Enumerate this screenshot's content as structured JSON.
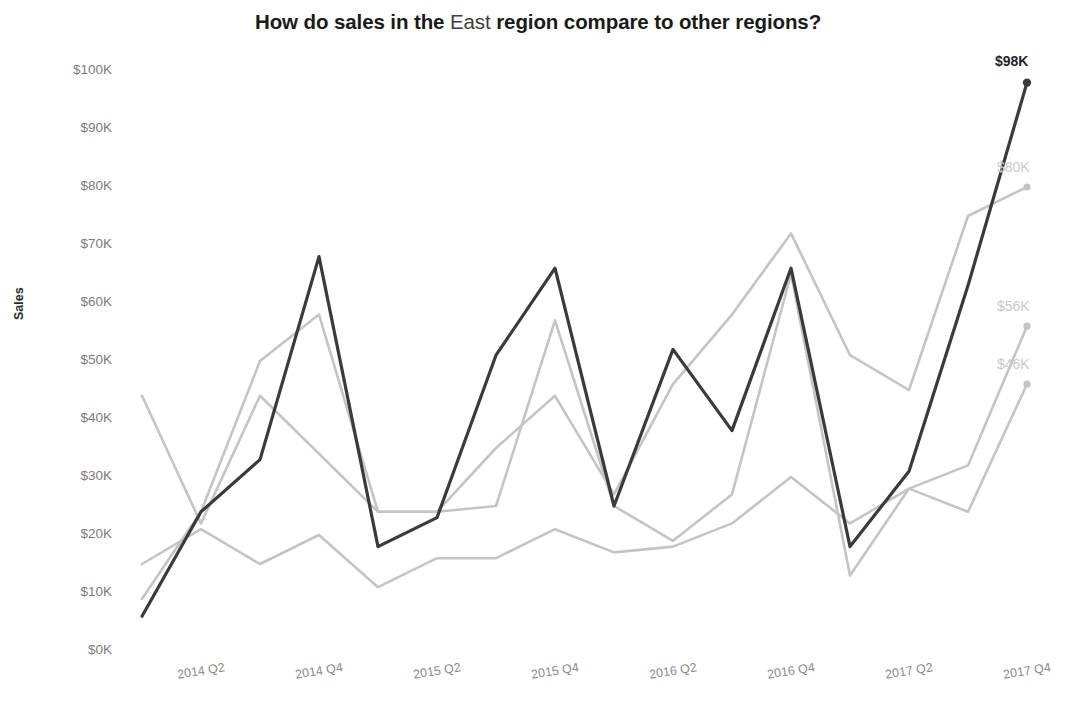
{
  "chart_data": {
    "type": "line",
    "title": "How do sales in the East region compare to other regions?",
    "title_emphasis": "East",
    "xlabel": "",
    "ylabel": "Sales",
    "ylim": [
      0,
      100000
    ],
    "grid": false,
    "legend": "none (end-of-line labels)",
    "y_tick_labels": [
      "$100K",
      "$90K",
      "$80K",
      "$70K",
      "$60K",
      "$50K",
      "$40K",
      "$30K",
      "$20K",
      "$10K",
      "$0K"
    ],
    "y_tick_values": [
      100000,
      90000,
      80000,
      70000,
      60000,
      50000,
      40000,
      30000,
      20000,
      10000,
      0
    ],
    "x": [
      "2014 Q1",
      "2014 Q2",
      "2014 Q3",
      "2014 Q4",
      "2015 Q1",
      "2015 Q2",
      "2015 Q3",
      "2015 Q4",
      "2016 Q1",
      "2016 Q2",
      "2016 Q3",
      "2016 Q4",
      "2017 Q1",
      "2017 Q2",
      "2017 Q3",
      "2017 Q4"
    ],
    "x_tick_labels": [
      "2014 Q2",
      "2014 Q4",
      "2015 Q2",
      "2015 Q4",
      "2016 Q2",
      "2016 Q4",
      "2017 Q2",
      "2017 Q4"
    ],
    "series": [
      {
        "name": "East",
        "color": "#3a3a3a",
        "highlight": true,
        "stroke_width": 3.2,
        "end_label": "$98K",
        "end_value": 98000,
        "values": [
          6000,
          24000,
          33000,
          68000,
          18000,
          23000,
          51000,
          66000,
          25000,
          52000,
          38000,
          66000,
          18000,
          31000,
          63000,
          98000
        ]
      },
      {
        "name": "Other region A",
        "color": "#c4c4c4",
        "highlight": false,
        "stroke_width": 2.6,
        "end_label": "$80K",
        "end_value": 80000,
        "values": [
          9000,
          24000,
          50000,
          58000,
          24000,
          24000,
          35000,
          44000,
          27000,
          46000,
          58000,
          72000,
          51000,
          45000,
          75000,
          80000
        ]
      },
      {
        "name": "Other region B",
        "color": "#c4c4c4",
        "highlight": false,
        "stroke_width": 2.6,
        "end_label": "$56K",
        "end_value": 56000,
        "values": [
          44000,
          22000,
          44000,
          34000,
          24000,
          24000,
          25000,
          57000,
          25000,
          19000,
          27000,
          65000,
          13000,
          28000,
          32000,
          56000
        ]
      },
      {
        "name": "Other region C",
        "color": "#c4c4c4",
        "highlight": false,
        "stroke_width": 2.6,
        "end_label": "$46K",
        "end_value": 46000,
        "values": [
          15000,
          21000,
          15000,
          20000,
          11000,
          16000,
          16000,
          21000,
          17000,
          18000,
          22000,
          30000,
          22000,
          28000,
          24000,
          46000
        ]
      }
    ]
  },
  "axis": {
    "y_title": "Sales"
  }
}
